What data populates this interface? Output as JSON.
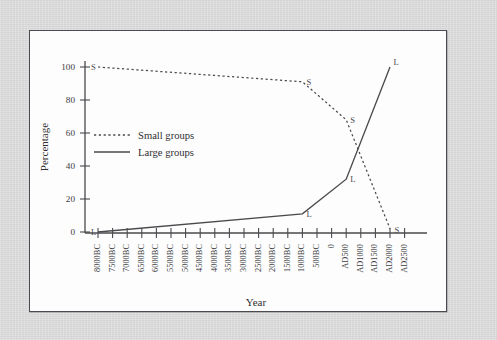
{
  "figure": {
    "background_color": "#d8d8d8",
    "panel_color": "#fdfdfd",
    "panel_border_color": "#4a4a50",
    "line_color": "#4a4a4e"
  },
  "chart_data": {
    "type": "line",
    "title": "",
    "xlabel": "Year",
    "ylabel": "Percentage",
    "ylim": [
      0,
      100
    ],
    "yticks": [
      0,
      20,
      40,
      60,
      80,
      100
    ],
    "grid": false,
    "legend_position": "center-left",
    "categories": [
      "8000BC",
      "7500BC",
      "7000BC",
      "6500BC",
      "6000BC",
      "5500BC",
      "5000BC",
      "4500BC",
      "4000BC",
      "3500BC",
      "3000BC",
      "2500BC",
      "2000BC",
      "1500BC",
      "1000BC",
      "500BC",
      "0",
      "AD500",
      "AD1000",
      "AD1500",
      "AD2000",
      "AD2500"
    ],
    "series": [
      {
        "name": "Small groups",
        "marker_label": "S",
        "style": "dotted",
        "points": [
          {
            "x": "8000BC",
            "y": 100
          },
          {
            "x": "1000BC",
            "y": 91
          },
          {
            "x": "AD500",
            "y": 68
          },
          {
            "x": "AD2000",
            "y": 2
          }
        ]
      },
      {
        "name": "Large groups",
        "marker_label": "L",
        "style": "solid",
        "points": [
          {
            "x": "8000BC",
            "y": 0
          },
          {
            "x": "1000BC",
            "y": 11
          },
          {
            "x": "AD500",
            "y": 32
          },
          {
            "x": "AD2000",
            "y": 100
          }
        ]
      }
    ],
    "annotations": [
      {
        "label": "S",
        "x": "8000BC",
        "y": 100
      },
      {
        "label": "S",
        "x": "1000BC",
        "y": 91
      },
      {
        "label": "S",
        "x": "AD500",
        "y": 68
      },
      {
        "label": "S",
        "x": "AD2000",
        "y": 2
      },
      {
        "label": "L",
        "x": "8000BC",
        "y": 0
      },
      {
        "label": "L",
        "x": "1000BC",
        "y": 11
      },
      {
        "label": "L",
        "x": "AD500",
        "y": 32
      },
      {
        "label": "L",
        "x": "AD2000",
        "y": 100
      }
    ],
    "legend": [
      {
        "label": "Small groups",
        "style": "dotted"
      },
      {
        "label": "Large groups",
        "style": "solid"
      }
    ]
  },
  "ytick_labels": [
    "100",
    "80",
    "60",
    "40",
    "20",
    "0"
  ],
  "axis_titles": {
    "x": "Year",
    "y": "Percentage"
  }
}
